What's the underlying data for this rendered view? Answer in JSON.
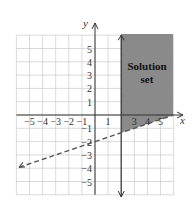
{
  "graph": {
    "x_axis_label": "x",
    "y_axis_label": "y",
    "x_ticks": [
      "−5",
      "−4",
      "−3",
      "−2",
      "−1",
      "1",
      "3",
      "4",
      "5"
    ],
    "y_ticks": [
      "5",
      "4",
      "3",
      "2",
      "1",
      "−1",
      "−2",
      "−3",
      "−4",
      "−5"
    ],
    "region_label_line1": "Solution",
    "region_label_line2": "set",
    "colors": {
      "grid": "#d0d0d0",
      "axes": "#333333",
      "shade": "#8a8a8a",
      "dashed_line": "#555555"
    },
    "boundaries": [
      {
        "type": "solid",
        "equation": "x = 2"
      },
      {
        "type": "dashed",
        "equation": "y = x/3 - 2"
      }
    ],
    "x_range": [
      -6,
      6
    ],
    "y_range": [
      -6,
      6
    ]
  }
}
